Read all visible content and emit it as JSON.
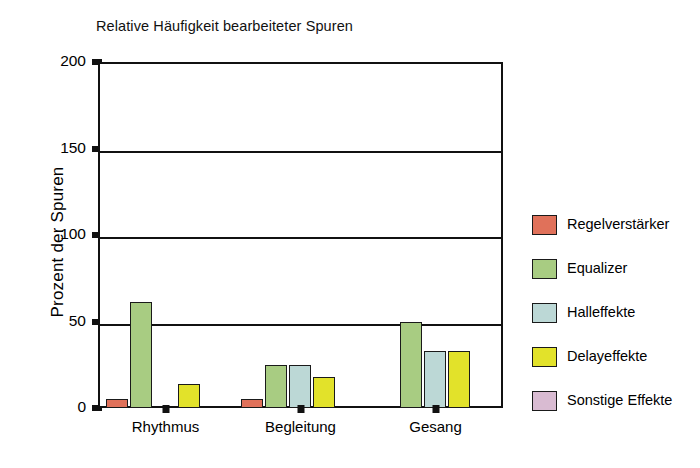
{
  "chart_data": {
    "type": "bar",
    "title": "Relative Häufigkeit bearbeiteter Spuren",
    "xlabel": "",
    "ylabel": "Prozent der Spuren",
    "categories": [
      "Rhythmus",
      "Begleitung",
      "Gesang"
    ],
    "ylim": [
      0,
      200
    ],
    "yticks": [
      0,
      50,
      100,
      150,
      200
    ],
    "ytick_labels": [
      "0",
      "50",
      "100",
      "150",
      "200"
    ],
    "grid": true,
    "legend_position": "right",
    "series": [
      {
        "name": "Regelverstärker",
        "color": "#E0715A",
        "values": [
          5,
          5,
          0
        ]
      },
      {
        "name": "Equalizer",
        "color": "#A8CC82",
        "values": [
          61,
          25,
          50
        ]
      },
      {
        "name": "Halleffekte",
        "color": "#BCD8D6",
        "values": [
          0,
          25,
          33
        ]
      },
      {
        "name": "Delayeffekte",
        "color": "#E2E22A",
        "values": [
          14,
          18,
          33
        ]
      },
      {
        "name": "Sonstige Effekte",
        "color": "#D9BBD2",
        "values": [
          0,
          0,
          0
        ]
      }
    ]
  },
  "legend": {
    "items": [
      {
        "label": "Regelverstärker",
        "color": "#E0715A"
      },
      {
        "label": "Equalizer",
        "color": "#A8CC82"
      },
      {
        "label": "Halleffekte",
        "color": "#BCD8D6"
      },
      {
        "label": "Delayeffekte",
        "color": "#E2E22A"
      },
      {
        "label": "Sonstige Effekte",
        "color": "#D9BBD2"
      }
    ]
  },
  "style": {
    "axis_color": "#111111",
    "background": "#ffffff",
    "bar_border": "#1a1a1a"
  }
}
